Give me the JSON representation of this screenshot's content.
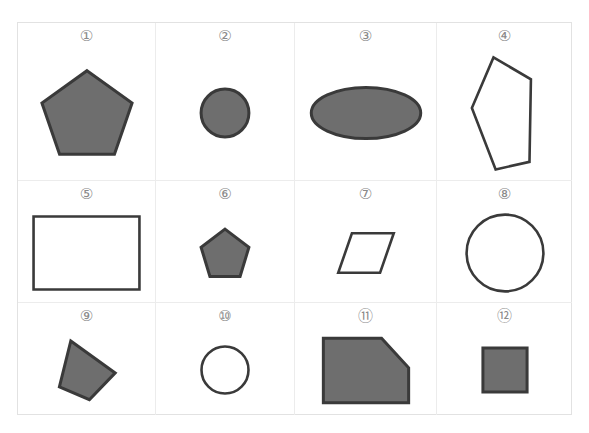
{
  "page": {
    "background_color": "#ffffff",
    "grid_border_color": "#e2e2e2",
    "grid_line_color": "#ececec",
    "shape_fill_color": "#6e6e6e",
    "shape_stroke_color": "#3a3a3a",
    "label_color": "#8a8a8a",
    "columns": 4,
    "rows": 3
  },
  "cells": [
    {
      "label": "①",
      "number": 1,
      "shape_name": "pentagon",
      "filled": true,
      "fill": "#6e6e6e",
      "stroke": "#3a3a3a",
      "viewbox": "0 0 100 100",
      "points": "50,6 96,40 78,94 22,94 4,40",
      "width": 98,
      "height": 95
    },
    {
      "label": "②",
      "number": 2,
      "shape_name": "circle",
      "filled": true,
      "fill": "#6e6e6e",
      "stroke": "#3a3a3a",
      "viewbox": "0 0 100 100",
      "points": "",
      "cx": 50,
      "cy": 50,
      "r": 46,
      "width": 52,
      "height": 52
    },
    {
      "label": "③",
      "number": 3,
      "shape_name": "ellipse",
      "filled": true,
      "fill": "#6e6e6e",
      "stroke": "#3a3a3a",
      "viewbox": "0 0 200 100",
      "points": "",
      "cx": 100,
      "cy": 50,
      "rx": 96,
      "ry": 44,
      "width": 114,
      "height": 58
    },
    {
      "label": "④",
      "number": 4,
      "shape_name": "irregular-pentagon",
      "filled": false,
      "fill": "none",
      "stroke": "#3a3a3a",
      "viewbox": "0 0 100 140",
      "points": "34,4 86,30 84,128 37,137 4,64",
      "width": 72,
      "height": 118
    },
    {
      "label": "⑤",
      "number": 5,
      "shape_name": "rectangle",
      "filled": false,
      "fill": "none",
      "stroke": "#3a3a3a",
      "viewbox": "0 0 140 100",
      "points": "2,2 138,2 138,98 2,98",
      "width": 109,
      "height": 76
    },
    {
      "label": "⑥",
      "number": 6,
      "shape_name": "pentagon",
      "filled": true,
      "fill": "#6e6e6e",
      "stroke": "#3a3a3a",
      "viewbox": "0 0 100 100",
      "points": "50,4 96,39 79,95 21,95 4,39",
      "width": 52,
      "height": 52
    },
    {
      "label": "⑦",
      "number": 7,
      "shape_name": "parallelogram",
      "filled": false,
      "fill": "none",
      "stroke": "#3a3a3a",
      "viewbox": "0 0 140 100",
      "points": "36,3 137,3 104,97 3,97",
      "width": 58,
      "height": 42
    },
    {
      "label": "⑧",
      "number": 8,
      "shape_name": "circle",
      "filled": false,
      "fill": "none",
      "stroke": "#3a3a3a",
      "viewbox": "0 0 100 100",
      "points": "",
      "cx": 50,
      "cy": 50,
      "r": 48,
      "width": 80,
      "height": 80
    },
    {
      "label": "⑨",
      "number": 9,
      "shape_name": "rotated-quadrilateral",
      "filled": true,
      "fill": "#6e6e6e",
      "stroke": "#3a3a3a",
      "viewbox": "0 0 100 110",
      "points": "23,5 97,60 54,106 4,84",
      "width": 60,
      "height": 64
    },
    {
      "label": "⑩",
      "number": 10,
      "shape_name": "circle",
      "filled": false,
      "fill": "none",
      "stroke": "#3a3a3a",
      "viewbox": "0 0 100 100",
      "points": "",
      "cx": 50,
      "cy": 50,
      "r": 47,
      "width": 50,
      "height": 50
    },
    {
      "label": "⑪",
      "number": 11,
      "shape_name": "cut-corner-rectangle",
      "filled": true,
      "fill": "#6e6e6e",
      "stroke": "#3a3a3a",
      "viewbox": "0 0 130 100",
      "points": "2,2 88,2 128,46 128,98 2,98",
      "width": 88,
      "height": 67
    },
    {
      "label": "⑫",
      "number": 12,
      "shape_name": "square",
      "filled": true,
      "fill": "#6e6e6e",
      "stroke": "#3a3a3a",
      "viewbox": "0 0 100 100",
      "points": "2,2 98,2 98,98 2,98",
      "width": 46,
      "height": 46
    }
  ]
}
